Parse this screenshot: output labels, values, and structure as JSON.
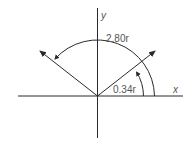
{
  "diagram": {
    "axes": {
      "x_label": "x",
      "y_label": "y"
    },
    "angles": [
      {
        "name": "small-angle",
        "label": "0.34r",
        "value": "0.34",
        "unit_glyph": "r"
      },
      {
        "name": "large-angle",
        "label": "2.80r",
        "value": "2.80",
        "unit_glyph": "r"
      }
    ],
    "vectors": [
      {
        "name": "vector-at-0.34",
        "direction": "upper-right"
      },
      {
        "name": "vector-at-2.80",
        "direction": "upper-left"
      }
    ],
    "colors": {
      "line": "#2a2a2a",
      "text": "#555555",
      "background": "#ffffff"
    }
  }
}
